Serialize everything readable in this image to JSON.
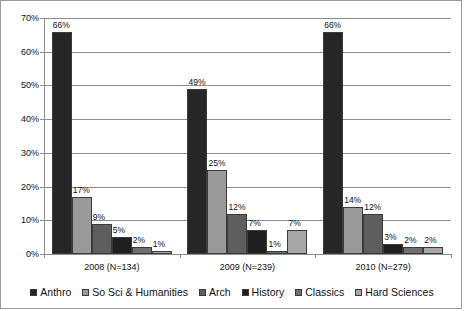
{
  "chart_data": {
    "type": "bar",
    "title": "",
    "subtitle": "",
    "xlabel": "",
    "ylabel": "",
    "ylim": [
      0,
      70
    ],
    "ytick_labels": [
      "0%",
      "10%",
      "20%",
      "30%",
      "40%",
      "50%",
      "60%",
      "70%"
    ],
    "ytick_values": [
      0,
      10,
      20,
      30,
      40,
      50,
      60,
      70
    ],
    "grid": true,
    "legend_position": "bottom",
    "categories": [
      "2008 (N=134)",
      "2009 (N=239)",
      "2010 (N=279)"
    ],
    "series": [
      {
        "name": "Anthro",
        "color": "#262626",
        "values": [
          66,
          49,
          66
        ],
        "labels": [
          "66%",
          "49%",
          "66%"
        ]
      },
      {
        "name": "So Sci & Humanities",
        "color": "#9a9a9a",
        "values": [
          17,
          25,
          14
        ],
        "labels": [
          "17%",
          "25%",
          "14%"
        ]
      },
      {
        "name": "Arch",
        "color": "#5e5e5e",
        "values": [
          9,
          12,
          12
        ],
        "labels": [
          "9%",
          "12%",
          "12%"
        ]
      },
      {
        "name": "History",
        "color": "#1f1f1f",
        "values": [
          5,
          7,
          3
        ],
        "labels": [
          "5%",
          "7%",
          "3%"
        ]
      },
      {
        "name": "Classics",
        "color": "#6e6e6e",
        "values": [
          2,
          1,
          2
        ],
        "labels": [
          "2%",
          "1%",
          "2%"
        ]
      },
      {
        "name": "Hard Sciences",
        "color": "#a8a8a8",
        "values": [
          1,
          7,
          2
        ],
        "labels": [
          "1%",
          "7%",
          "2%"
        ]
      }
    ]
  }
}
